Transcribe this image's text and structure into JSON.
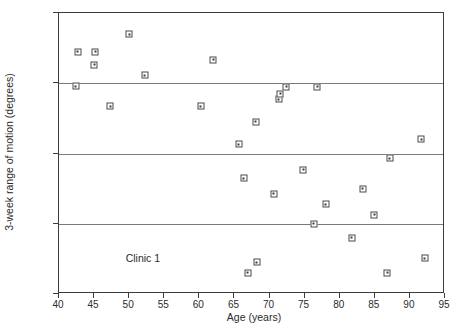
{
  "chart_data": {
    "type": "scatter",
    "title": "",
    "xlabel": "Age (years)",
    "ylabel": "3-week range of motion (degrees)",
    "xlim": [
      40,
      95
    ],
    "ylim": [
      25,
      105
    ],
    "xticks": [
      40,
      45,
      50,
      55,
      60,
      65,
      70,
      75,
      80,
      85,
      90,
      95
    ],
    "yticks": [
      25,
      45,
      65,
      85,
      105
    ],
    "grid": "horizontal gridlines at y = 45, 65, 85",
    "legend": "none",
    "annotations": [
      {
        "text": "Clinic 1",
        "x": 49.5,
        "y": 37
      }
    ],
    "marker_style": "open square with center dot",
    "points": [
      {
        "x": 42.4,
        "y": 84.2
      },
      {
        "x": 42.7,
        "y": 94.0
      },
      {
        "x": 45.0,
        "y": 90.2
      },
      {
        "x": 45.2,
        "y": 94.0
      },
      {
        "x": 47.3,
        "y": 78.5
      },
      {
        "x": 50.0,
        "y": 99.0
      },
      {
        "x": 52.2,
        "y": 87.3
      },
      {
        "x": 60.2,
        "y": 78.5
      },
      {
        "x": 62.0,
        "y": 91.7
      },
      {
        "x": 65.6,
        "y": 67.6
      },
      {
        "x": 66.3,
        "y": 58.0
      },
      {
        "x": 66.9,
        "y": 31.0
      },
      {
        "x": 68.0,
        "y": 74.0
      },
      {
        "x": 68.2,
        "y": 34.0
      },
      {
        "x": 70.6,
        "y": 53.5
      },
      {
        "x": 71.3,
        "y": 80.4
      },
      {
        "x": 71.5,
        "y": 82.0
      },
      {
        "x": 72.4,
        "y": 84.0
      },
      {
        "x": 74.8,
        "y": 60.4
      },
      {
        "x": 76.3,
        "y": 45.0
      },
      {
        "x": 76.8,
        "y": 84.0
      },
      {
        "x": 78.0,
        "y": 50.5
      },
      {
        "x": 81.7,
        "y": 41.0
      },
      {
        "x": 83.3,
        "y": 55.0
      },
      {
        "x": 84.9,
        "y": 47.5
      },
      {
        "x": 86.8,
        "y": 31.0
      },
      {
        "x": 87.1,
        "y": 63.6
      },
      {
        "x": 91.6,
        "y": 69.0
      },
      {
        "x": 92.1,
        "y": 35.2
      }
    ]
  },
  "chart": {
    "xlabel": "Age (years)",
    "ylabel": "3-week range of motion (degrees)",
    "annotation_label": "Clinic 1",
    "xticklabels": [
      "40",
      "45",
      "50",
      "55",
      "60",
      "65",
      "70",
      "75",
      "80",
      "85",
      "90",
      "95"
    ],
    "yticklabels": [
      "105",
      "85",
      "65",
      "45",
      "25"
    ],
    "colors": {
      "axis": "#3c3c3c",
      "gridline": "#7a7a7a",
      "marker_edge": "#4a4a4a",
      "marker_fill": "#ffffff",
      "text": "#2b2b2b",
      "background": "#ffffff"
    }
  }
}
